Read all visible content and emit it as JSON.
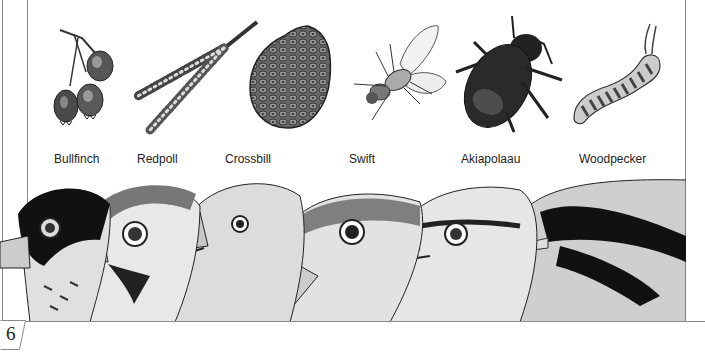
{
  "page": {
    "number": "6"
  },
  "foods": [
    {
      "id": "berries",
      "icon": "berries-icon",
      "bird": "Bullfinch"
    },
    {
      "id": "catkin",
      "icon": "catkin-icon",
      "bird": "Redpoll"
    },
    {
      "id": "pine-cone",
      "icon": "pine-cone-icon",
      "bird": "Crossbill"
    },
    {
      "id": "fly",
      "icon": "fly-icon",
      "bird": "Swift"
    },
    {
      "id": "beetle",
      "icon": "beetle-icon",
      "bird": "Akiapolaau"
    },
    {
      "id": "caterpillar",
      "icon": "caterpillar-icon",
      "bird": "Woodpecker"
    }
  ],
  "captions": [
    "Bullfinch",
    "Redpoll",
    "Crossbill",
    "Swift",
    "Akiapolaau",
    "Woodpecker"
  ],
  "colors": {
    "ink": "#222222",
    "frame": "#8a8a8a",
    "paper": "#ffffff"
  }
}
